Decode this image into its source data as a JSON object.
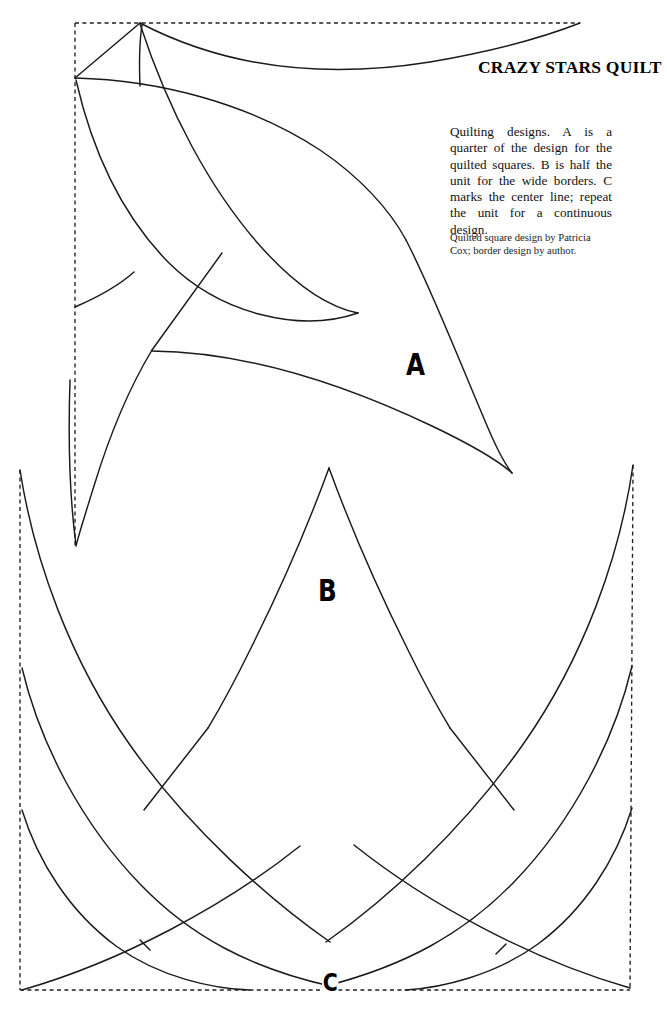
{
  "document": {
    "kind": "quilting-pattern-plate",
    "background_color": "#ffffff",
    "ink_color": "#000000",
    "width": 667,
    "height": 1023
  },
  "title": "CRAZY STARS QUILT",
  "description": "Quilting designs. A is a quarter of the design for the quilted squares. B is half the unit for the wide borders. C marks the center line; repeat the unit for a continuous design.",
  "credit": "Quilted square design by Patricia Cox; border design by author.",
  "labels": {
    "a": "A",
    "b": "B",
    "c": "C"
  },
  "panels": [
    {
      "id": "A",
      "name": "quilted-square-quarter",
      "label": "A",
      "border_style": "dashed",
      "note": "A is a quarter of the design for the quilted squares"
    },
    {
      "id": "B",
      "name": "wide-border-half-unit",
      "label": "B",
      "border_style": "dashed",
      "note": "B is half the unit for the wide borders"
    },
    {
      "id": "C",
      "name": "center-line-marker",
      "label": "C",
      "note": "C marks the center line; repeat the unit for a continuous design"
    }
  ]
}
